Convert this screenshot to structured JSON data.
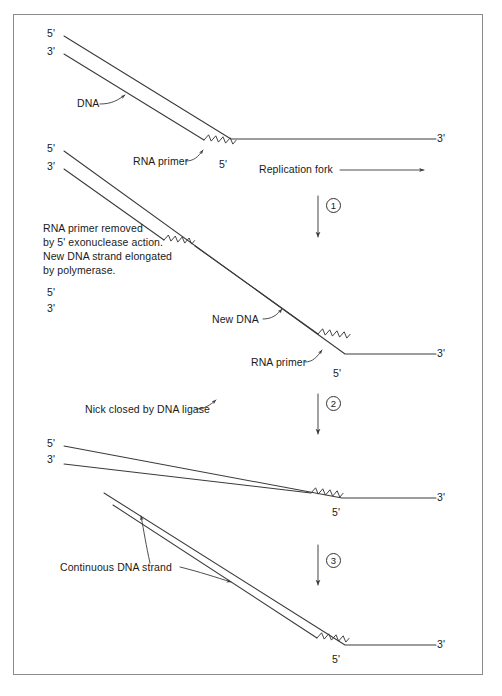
{
  "figure": {
    "line_color": "#3a3a3a",
    "text_color": "#1a1a1a",
    "border_color": "#8b8b8b",
    "background": "#ffffff"
  },
  "panels": [
    {
      "id": "panel-1",
      "end_labels": {
        "left_top": "5'",
        "left_bottom": "3'",
        "right": "3'",
        "fork_vertex": "5'"
      },
      "annotations": [
        {
          "name": "dna-label",
          "text": "DNA"
        },
        {
          "name": "rna-primer-label",
          "text": "RNA primer"
        },
        {
          "name": "replication-fork-label",
          "text": "Replication fork"
        }
      ]
    },
    {
      "id": "panel-2",
      "end_labels": {
        "left_top": "5'",
        "left_bottom": "3'",
        "right": "3'",
        "fork_vertex": "5'"
      },
      "annotations": [
        {
          "name": "new-dna-label",
          "text": "New DNA"
        },
        {
          "name": "rna-primer-label",
          "text": "RNA primer"
        }
      ],
      "caption_lines": [
        "RNA primer removed",
        "by 5' exonuclease action.",
        "New DNA strand elongated",
        "by polymerase."
      ]
    },
    {
      "id": "panel-3",
      "end_labels": {
        "left_top": "5'",
        "left_bottom": "3'",
        "right": "3'",
        "fork_vertex": "5'"
      },
      "annotations": [
        {
          "name": "nick-closed-label",
          "text": "Nick closed by DNA ligase"
        }
      ]
    },
    {
      "id": "panel-4",
      "end_labels": {
        "right": "3'",
        "fork_vertex": "5'"
      },
      "annotations": [
        {
          "name": "continuous-dna-strand-label",
          "text": "Continuous DNA strand"
        }
      ]
    }
  ],
  "steps": [
    {
      "name": "step-1",
      "number": "1"
    },
    {
      "name": "step-2",
      "number": "2"
    },
    {
      "name": "step-3",
      "number": "3"
    }
  ],
  "labels": {
    "prime_5": "5'",
    "prime_3": "3'",
    "dna": "DNA",
    "rna_primer": "RNA primer",
    "replication_fork": "Replication fork",
    "new_dna": "New DNA",
    "nick_closed": "Nick closed by DNA ligase",
    "continuous_strand": "Continuous DNA strand",
    "caption_l1": "RNA primer removed",
    "caption_l2": "by 5' exonuclease action.",
    "caption_l3": "New DNA strand elongated",
    "caption_l4": "by polymerase."
  }
}
